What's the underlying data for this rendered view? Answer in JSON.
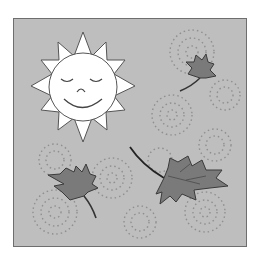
{
  "image": {
    "description": "Grayscale clip-art: smiling sun with closed eyes and three maple leaves blowing among dotted wind swirls, inside a bordered gray square",
    "colors": {
      "background": "#ffffff",
      "panel": "#bebebe",
      "border": "#6e6e6e",
      "sun_fill": "#ffffff",
      "line": "#555555",
      "leaf_fill": "#7a7a7a",
      "leaf_dark": "#3c3c3c",
      "swirl_dots": "#8c8c8c"
    },
    "elements": [
      {
        "name": "sun",
        "cx": 83,
        "cy": 87,
        "r": 35,
        "rays": 12
      },
      {
        "name": "leaf-top-right",
        "cx": 200,
        "cy": 70
      },
      {
        "name": "leaf-bottom-left",
        "cx": 78,
        "cy": 185
      },
      {
        "name": "leaf-bottom-right",
        "cx": 182,
        "cy": 180
      }
    ]
  }
}
